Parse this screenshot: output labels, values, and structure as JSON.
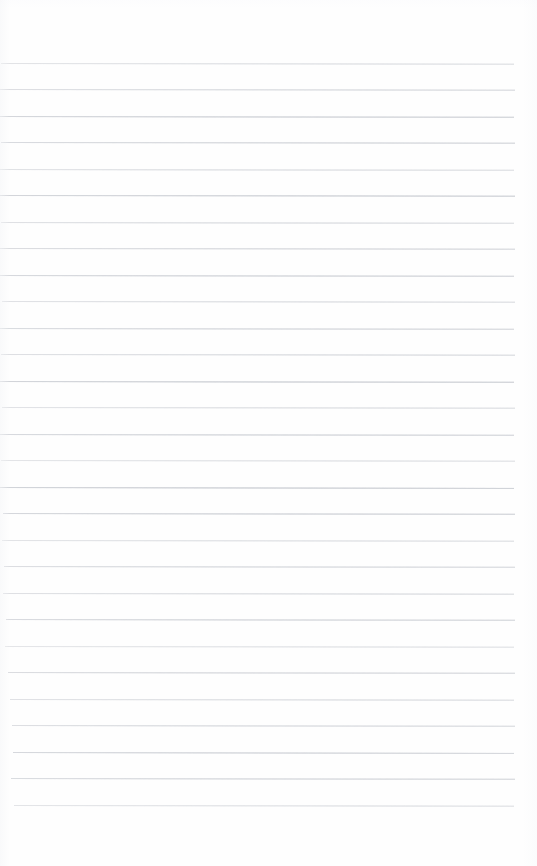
{
  "document": {
    "kind": "scanned-blank-ruled-page",
    "title": "Blank Ruled Notebook Page",
    "page_width": 537,
    "page_height": 866,
    "background_color": "#fefefe",
    "text_content": "",
    "handwriting_present": false,
    "margin_rule_present": false,
    "header_text": "",
    "footer_text": "",
    "page_number": ""
  },
  "ruling": {
    "line_color": "#c9ccd2",
    "line_count": 29,
    "first_line_y": 63,
    "line_spacing": 26.5,
    "line_thickness": 1,
    "right_edge_x": 515,
    "bottom_blank_space": 46,
    "lines": [
      {
        "y": 63,
        "x_start": 1,
        "x_end": 514,
        "opacity": 0.52,
        "slope": 0.7
      },
      {
        "y": 89,
        "x_start": 0,
        "x_end": 515,
        "opacity": 0.62,
        "slope": 0.7
      },
      {
        "y": 116,
        "x_start": 0,
        "x_end": 514,
        "opacity": 0.78,
        "slope": 0.8
      },
      {
        "y": 142,
        "x_start": 1,
        "x_end": 515,
        "opacity": 0.7,
        "slope": 0.7
      },
      {
        "y": 169,
        "x_start": 0,
        "x_end": 514,
        "opacity": 0.55,
        "slope": 0.8
      },
      {
        "y": 195,
        "x_start": 0,
        "x_end": 515,
        "opacity": 0.8,
        "slope": 0.7
      },
      {
        "y": 222,
        "x_start": 1,
        "x_end": 514,
        "opacity": 0.58,
        "slope": 0.8
      },
      {
        "y": 248,
        "x_start": 0,
        "x_end": 515,
        "opacity": 0.66,
        "slope": 0.7
      },
      {
        "y": 275,
        "x_start": 0,
        "x_end": 514,
        "opacity": 0.74,
        "slope": 0.8
      },
      {
        "y": 301,
        "x_start": 2,
        "x_end": 515,
        "opacity": 0.56,
        "slope": 0.7
      },
      {
        "y": 328,
        "x_start": 0,
        "x_end": 514,
        "opacity": 0.68,
        "slope": 0.8
      },
      {
        "y": 354,
        "x_start": 1,
        "x_end": 515,
        "opacity": 0.6,
        "slope": 0.7
      },
      {
        "y": 381,
        "x_start": 0,
        "x_end": 514,
        "opacity": 0.82,
        "slope": 0.8
      },
      {
        "y": 407,
        "x_start": 2,
        "x_end": 515,
        "opacity": 0.54,
        "slope": 0.7
      },
      {
        "y": 434,
        "x_start": 0,
        "x_end": 514,
        "opacity": 0.72,
        "slope": 0.8
      },
      {
        "y": 460,
        "x_start": 1,
        "x_end": 515,
        "opacity": 0.5,
        "slope": 0.7
      },
      {
        "y": 487,
        "x_start": 0,
        "x_end": 514,
        "opacity": 0.84,
        "slope": 0.9
      },
      {
        "y": 513,
        "x_start": 3,
        "x_end": 515,
        "opacity": 0.76,
        "slope": 0.8
      },
      {
        "y": 540,
        "x_start": 2,
        "x_end": 514,
        "opacity": 0.52,
        "slope": 0.7
      },
      {
        "y": 566,
        "x_start": 4,
        "x_end": 515,
        "opacity": 0.64,
        "slope": 0.8
      },
      {
        "y": 593,
        "x_start": 3,
        "x_end": 514,
        "opacity": 0.58,
        "slope": 0.7
      },
      {
        "y": 619,
        "x_start": 6,
        "x_end": 515,
        "opacity": 0.7,
        "slope": 0.8
      },
      {
        "y": 646,
        "x_start": 5,
        "x_end": 514,
        "opacity": 0.48,
        "slope": 0.7
      },
      {
        "y": 672,
        "x_start": 8,
        "x_end": 515,
        "opacity": 0.66,
        "slope": 0.8
      },
      {
        "y": 699,
        "x_start": 10,
        "x_end": 514,
        "opacity": 0.56,
        "slope": 0.7
      },
      {
        "y": 725,
        "x_start": 12,
        "x_end": 515,
        "opacity": 0.62,
        "slope": 0.8
      },
      {
        "y": 752,
        "x_start": 13,
        "x_end": 514,
        "opacity": 0.74,
        "slope": 0.9
      },
      {
        "y": 778,
        "x_start": 11,
        "x_end": 515,
        "opacity": 0.68,
        "slope": 0.8
      },
      {
        "y": 805,
        "x_start": 14,
        "x_end": 514,
        "opacity": 0.5,
        "slope": 0.7
      }
    ]
  }
}
